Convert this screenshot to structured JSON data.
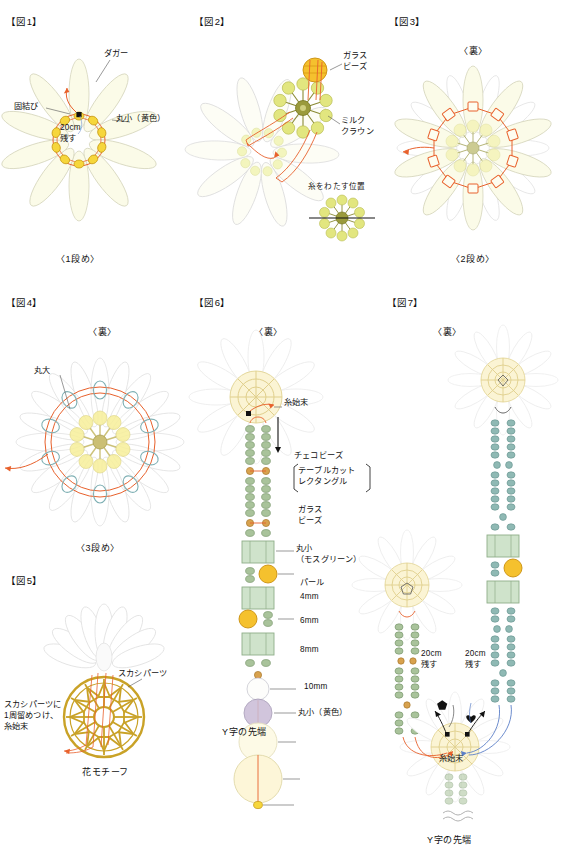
{
  "document": {
    "type": "beading-instruction-diagram",
    "language": "ja",
    "title": "ビーズ花モチーフ 作り方図解"
  },
  "colors": {
    "thread_orange": "#e8612c",
    "thread_blue": "#5b7fc7",
    "petal_fill": "#fbfbe8",
    "petal_stroke": "#d8d8c0",
    "petal_ghost": "#ececec",
    "bead_yellow": "#f4d22a",
    "bead_yellow_stroke": "#c79a13",
    "bead_green": "#9fbb8e",
    "bead_green_stroke": "#6d8f63",
    "bead_teal": "#8fb9b4",
    "czech_fill": "#cfe3cb",
    "pearl_lavender": "#c9bcd6",
    "pearl_cream": "#fcf6dd",
    "motif_gold": "#c9a227",
    "milk_crown": "#e2e67f",
    "text": "#111111"
  },
  "figures": [
    {
      "id": "fig1",
      "label": "【図1】",
      "caption": "〈1段め〉",
      "annotations": [
        {
          "name": "dagger",
          "text": "ダガー"
        },
        {
          "name": "knot",
          "text": "固結び"
        },
        {
          "name": "round-small-yellow",
          "text": "丸小（黄色）"
        },
        {
          "name": "leave-20cm",
          "text": "20cm\n残す"
        }
      ]
    },
    {
      "id": "fig2",
      "label": "【図2】",
      "caption": "",
      "annotations": [
        {
          "name": "glass-bead",
          "text": "ガラス\nビーズ"
        },
        {
          "name": "milk-crown",
          "text": "ミルク\nクラウン"
        },
        {
          "name": "thread-pass-position",
          "text": "糸をわたす位置"
        }
      ]
    },
    {
      "id": "fig3",
      "label": "【図3】",
      "caption": "〈2段め〉",
      "side_label": "〈裏〉",
      "annotations": []
    },
    {
      "id": "fig4",
      "label": "【図4】",
      "caption": "〈3段め〉",
      "side_label": "〈裏〉",
      "annotations": [
        {
          "name": "round-large",
          "text": "丸大"
        }
      ]
    },
    {
      "id": "fig5",
      "label": "【図5】",
      "caption": "花モチーフ",
      "annotations": [
        {
          "name": "openwork-part",
          "text": "スカシパーツ"
        },
        {
          "name": "attach-instruction",
          "text": "スカシパーツに\n1周留めつけ、\n糸始末"
        }
      ]
    },
    {
      "id": "fig6",
      "label": "【図6】",
      "caption": "Y字の先端",
      "side_label": "〈裏〉",
      "annotations": [
        {
          "name": "thread-start-end",
          "text": "糸始末"
        },
        {
          "name": "czech-bead",
          "text": "チェコビーズ"
        },
        {
          "name": "czech-bead-sub",
          "text": "テーブルカット\nレクタングル"
        },
        {
          "name": "glass-bead",
          "text": "ガラス\nビーズ"
        },
        {
          "name": "round-small-moss",
          "text": "丸小\n（モスグリーン）"
        },
        {
          "name": "pearl",
          "text": "パール"
        },
        {
          "name": "pearl-4mm",
          "text": "4mm"
        },
        {
          "name": "pearl-6mm",
          "text": "6mm"
        },
        {
          "name": "pearl-8mm",
          "text": "8mm"
        },
        {
          "name": "pearl-10mm",
          "text": "10mm"
        },
        {
          "name": "round-small-yellow",
          "text": "丸小（黄色）"
        }
      ]
    },
    {
      "id": "fig7",
      "label": "【図7】",
      "caption": "Y字の先端",
      "side_label": "〈裏〉",
      "annotations": [
        {
          "name": "leave-20cm-left",
          "text": "20cm\n残す"
        },
        {
          "name": "leave-20cm-right",
          "text": "20cm\n残す"
        },
        {
          "name": "thread-start-end",
          "text": "糸始末"
        }
      ]
    }
  ],
  "materials": [
    {
      "name": "dagger",
      "label": "ダガー"
    },
    {
      "name": "round-small-yellow",
      "label": "丸小（黄色）"
    },
    {
      "name": "round-large",
      "label": "丸大"
    },
    {
      "name": "glass-bead",
      "label": "ガラスビーズ"
    },
    {
      "name": "milk-crown",
      "label": "ミルククラウン"
    },
    {
      "name": "czech-bead",
      "label": "チェコビーズ"
    },
    {
      "name": "czech-bead-shape",
      "label": "テーブルカットレクタングル"
    },
    {
      "name": "round-small-moss",
      "label": "丸小（モスグリーン）"
    },
    {
      "name": "pearl",
      "label": "パール"
    },
    {
      "name": "openwork-part",
      "label": "スカシパーツ"
    },
    {
      "name": "flower-motif",
      "label": "花モチーフ"
    }
  ],
  "pearl_sizes": [
    "4mm",
    "6mm",
    "8mm",
    "10mm"
  ],
  "steps": {
    "row1": "〈1段め〉",
    "row2": "〈2段め〉",
    "row3": "〈3段め〉"
  },
  "common": {
    "back_side": "〈裏〉",
    "y_tip": "Y字の先端",
    "thread_finish": "糸始末",
    "leave_20cm": "20cm\n残す"
  }
}
